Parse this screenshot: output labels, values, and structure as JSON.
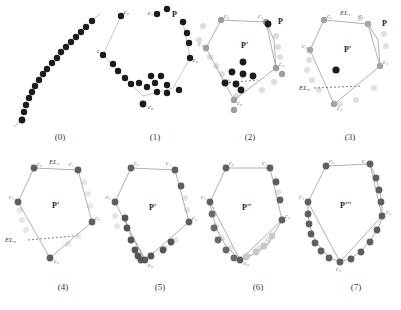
{
  "figure": {
    "kind": "geometric-algorithm-illustration",
    "panel_count": 8,
    "colors": {
      "dot_dark": "#1b1b1b",
      "dot_mid": "#6f6f6f",
      "dot_light": "#c9c9c9",
      "dot_faint": "#e2e2e2",
      "edge": "#9a9a9a",
      "edge_dark": "#8a8a8a",
      "text": "#2b2b2b",
      "background": "#ffffff"
    }
  },
  "captions": [
    {
      "id": "p0",
      "label": "(0)"
    },
    {
      "id": "p1",
      "label": "(1)"
    },
    {
      "id": "p2",
      "label": "(2)"
    },
    {
      "id": "p3",
      "label": "(3)"
    },
    {
      "id": "p4",
      "label": "(4)"
    },
    {
      "id": "p5",
      "label": "(5)"
    },
    {
      "id": "p6",
      "label": "(6)"
    },
    {
      "id": "p7",
      "label": "(7)"
    }
  ],
  "labels": {
    "c0": "c₀",
    "c1": "c₁",
    "c2": "c₂",
    "c3": "c₃",
    "c4": "c₄",
    "P": "P",
    "P1": "P'",
    "P2": "P''",
    "P3": "P'''",
    "EL1": "EL₁",
    "EL3": "EL₃"
  },
  "panels": {
    "p0": {
      "caption": "(0)",
      "description": "dense diagonal chain of sample points",
      "point_labels": [
        "c₀"
      ],
      "dot_count": 18
    },
    "p1": {
      "caption": "(1)",
      "description": "scattered point cloud with polyline",
      "point_labels": [
        "c₀",
        "c₁",
        "c₂",
        "c₃",
        "c₄"
      ],
      "region_labels": [
        "P"
      ]
    },
    "p2": {
      "caption": "(2)",
      "description": "polygon with interior point cluster and dashed chord",
      "point_labels": [
        "c₀",
        "c₁",
        "c₂",
        "c₃",
        "c₄"
      ],
      "region_labels": [
        "P",
        "P'"
      ],
      "interior_dots": 8
    },
    "p3": {
      "caption": "(3)",
      "description": "polygon with single interior point and edge labels",
      "point_labels": [
        "c₀",
        "c₁",
        "c₂",
        "c₃",
        "c₄"
      ],
      "region_labels": [
        "P",
        "P'"
      ],
      "edge_labels": [
        "EL₁",
        "EL₃"
      ],
      "interior_dots": 1
    },
    "p4": {
      "caption": "(4)",
      "description": "clean polygon P' with labelled edges",
      "point_labels": [
        "c₀",
        "c₁",
        "c₂",
        "c₃",
        "c₄"
      ],
      "region_labels": [
        "P'"
      ],
      "edge_labels": [
        "EL₁",
        "EL₃"
      ]
    },
    "p5": {
      "caption": "(5)",
      "description": "polygon P' with refined points along lower-left boundary",
      "point_labels": [
        "c₀",
        "c₁",
        "c₂",
        "c₃",
        "c₄"
      ],
      "region_labels": [
        "P'"
      ]
    },
    "p6": {
      "caption": "(6)",
      "description": "polygon P'' with points along the lower boundary",
      "point_labels": [
        "c₀",
        "c₁",
        "c₂",
        "c₃",
        "c₄"
      ],
      "region_labels": [
        "P''"
      ]
    },
    "p7": {
      "caption": "(7)",
      "description": "polygon P''' fully refined with dense boundary points",
      "point_labels": [
        "c₀",
        "c₁",
        "c₂",
        "c₃",
        "c₄"
      ],
      "region_labels": [
        "P'''"
      ]
    }
  }
}
